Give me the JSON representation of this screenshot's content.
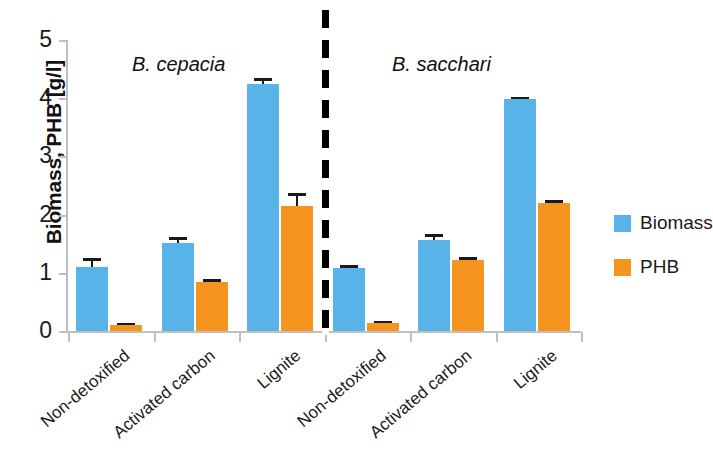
{
  "chart_data": {
    "type": "bar",
    "title": "",
    "xlabel": "",
    "ylabel": "Biomass, PHB [g/l]",
    "ylim": [
      0,
      5
    ],
    "yticks": [
      "0",
      "1",
      "2",
      "3",
      "4",
      "5"
    ],
    "grid": false,
    "legend_position": "right",
    "categories": [
      "Non-detoxified",
      "Activated carbon",
      "Lignite",
      "Non-detoxified",
      "Activated carbon",
      "Lignite"
    ],
    "group_labels": [
      "B. cepacia",
      "B. sacchari"
    ],
    "series": [
      {
        "name": "Biomass",
        "color": "#58b4e8",
        "values": [
          1.1,
          1.51,
          4.24,
          1.09,
          1.56,
          3.98
        ],
        "errors": [
          0.15,
          0.1,
          0.1,
          0.05,
          0.1,
          0.04
        ]
      },
      {
        "name": "PHB",
        "color": "#f5941e",
        "values": [
          0.1,
          0.84,
          2.15,
          0.14,
          1.22,
          2.2
        ],
        "errors": [
          0.03,
          0.05,
          0.23,
          0.03,
          0.06,
          0.05
        ]
      }
    ]
  },
  "axis": {
    "y_title": "Biomass, PHB [g/l]",
    "y_tick_labels": [
      "5",
      "4",
      "3",
      "2",
      "1",
      "0"
    ]
  },
  "annotations": {
    "species_left": "B. cepacia",
    "species_right": "B. sacchari"
  },
  "legend": {
    "items": [
      {
        "label": "Biomass",
        "color": "#58b4e8"
      },
      {
        "label": "PHB",
        "color": "#f5941e"
      }
    ]
  },
  "categories_display": [
    "Non-detoxified",
    "Activated carbon",
    "Lignite",
    "Non-detoxified",
    "Activated carbon",
    "Lignite"
  ]
}
